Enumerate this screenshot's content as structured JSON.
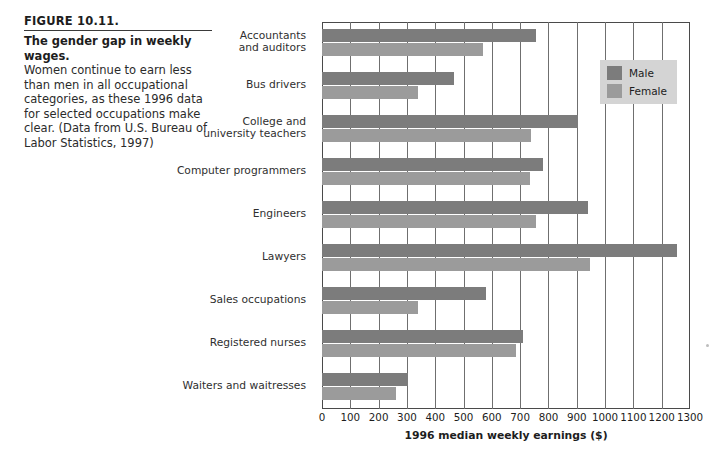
{
  "caption": {
    "figure_number": "FIGURE 10.11.",
    "title": "The gender gap in weekly wages.",
    "body": "Women continue to earn less than men in all occupational categories, as these 1996 data for selected occupations make clear. (Data from U.S. Bureau of Labor Statistics, 1997)"
  },
  "legend": {
    "items": [
      {
        "label": "Male",
        "color": "#7c7c7c"
      },
      {
        "label": "Female",
        "color": "#9b9b9b"
      }
    ]
  },
  "chart_data": {
    "type": "bar",
    "orientation": "horizontal",
    "title": "The gender gap in weekly wages.",
    "xlabel": "1996 median weekly earnings ($)",
    "ylabel": "",
    "xlim": [
      0,
      1300
    ],
    "xticks": [
      0,
      100,
      200,
      300,
      400,
      500,
      600,
      700,
      800,
      900,
      1000,
      1100,
      1200,
      1300
    ],
    "grid": true,
    "legend_position": "top-right",
    "categories": [
      "Accountants and auditors",
      "Bus drivers",
      "College and university teachers",
      "Computer programmers",
      "Engineers",
      "Lawyers",
      "Sales occupations",
      "Registered nurses",
      "Waiters and waitresses"
    ],
    "category_label_lines": [
      [
        "Accountants",
        "and auditors"
      ],
      [
        "Bus drivers"
      ],
      [
        "College and",
        "university teachers"
      ],
      [
        "Computer programmers"
      ],
      [
        "Engineers"
      ],
      [
        "Lawyers"
      ],
      [
        "Sales occupations"
      ],
      [
        "Registered nurses"
      ],
      [
        "Waiters and waitresses"
      ]
    ],
    "series": [
      {
        "name": "Male",
        "color": "#7c7c7c",
        "values": [
          755,
          465,
          905,
          780,
          940,
          1255,
          580,
          710,
          305
        ]
      },
      {
        "name": "Female",
        "color": "#9b9b9b",
        "values": [
          570,
          340,
          740,
          735,
          755,
          945,
          340,
          685,
          260
        ]
      }
    ]
  }
}
